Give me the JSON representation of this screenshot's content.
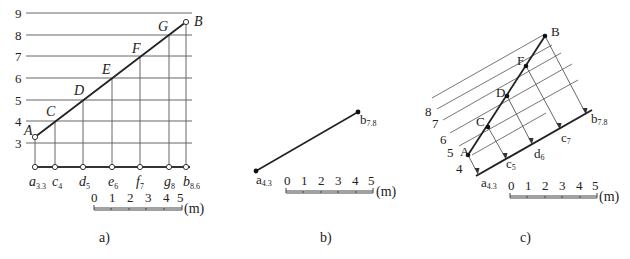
{
  "panel_a": {
    "caption": "a)",
    "levels": [
      "3",
      "4",
      "5",
      "6",
      "7",
      "8",
      "9"
    ],
    "points": [
      {
        "name": "A",
        "label": "a",
        "sub": "3.3"
      },
      {
        "name": "C",
        "label": "c",
        "sub": "4"
      },
      {
        "name": "D",
        "label": "d",
        "sub": "5"
      },
      {
        "name": "E",
        "label": "e",
        "sub": "6"
      },
      {
        "name": "F",
        "label": "f",
        "sub": "7"
      },
      {
        "name": "G",
        "label": "g",
        "sub": "8"
      },
      {
        "name": "B",
        "label": "b",
        "sub": "8.6"
      }
    ],
    "scale": {
      "ticks": [
        "0",
        "1",
        "2",
        "3",
        "4",
        "5"
      ],
      "unit": "(m)"
    }
  },
  "panel_b": {
    "caption": "b)",
    "start": {
      "label": "a",
      "sub": "4.3"
    },
    "end": {
      "label": "b",
      "sub": "7.8"
    },
    "scale": {
      "ticks": [
        "0",
        "1",
        "2",
        "3",
        "4",
        "5"
      ],
      "unit": "(m)"
    }
  },
  "panel_c": {
    "caption": "c)",
    "levels": [
      "4",
      "5",
      "6",
      "7",
      "8"
    ],
    "points": [
      {
        "name": "A",
        "label": "a",
        "sub": "4.3"
      },
      {
        "name": "C",
        "label": "c",
        "sub": "5"
      },
      {
        "name": "D",
        "label": "d",
        "sub": "6"
      },
      {
        "name": "F",
        "label": "c",
        "sub": "7"
      },
      {
        "name": "B",
        "label": "b",
        "sub": "7.8"
      }
    ],
    "scale": {
      "ticks": [
        "0",
        "1",
        "2",
        "3",
        "4",
        "5"
      ],
      "unit": "(m)"
    }
  }
}
